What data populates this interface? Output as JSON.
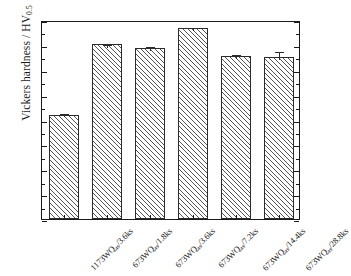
{
  "chart_data": {
    "type": "bar",
    "title": "",
    "xlabel": "",
    "ylabel": "Vickers hardness / HV",
    "ylabel_sub": "0.5",
    "ylim": [
      0,
      400
    ],
    "ytick_step": 50,
    "yminor_step": 25,
    "grid": false,
    "legend": "none",
    "categories": [
      "1173WQ as /3.6ks",
      "673WQ as /1.8ks",
      "673WQ as /3.6ks",
      "673WQ as /7.2ks",
      "673WQ as /14.4ks",
      "673WQ as /28.8ks"
    ],
    "category_parts": [
      {
        "main": "1173WQ",
        "sub": "as",
        "tail": "/3.6ks"
      },
      {
        "main": "673WQ",
        "sub": "as",
        "tail": "/1.8ks"
      },
      {
        "main": "673WQ",
        "sub": "as",
        "tail": "/3.6ks"
      },
      {
        "main": "673WQ",
        "sub": "as",
        "tail": "/7.2ks"
      },
      {
        "main": "673WQ",
        "sub": "as",
        "tail": "/14.4ks"
      },
      {
        "main": "673WQ",
        "sub": "as",
        "tail": "/28.8ks"
      }
    ],
    "values": [
      210,
      351,
      343,
      383,
      327,
      325
    ],
    "errors": [
      5,
      3,
      7,
      5,
      6,
      14
    ],
    "ytick_labels": [
      "0",
      "50",
      "100",
      "150",
      "200",
      "250",
      "300",
      "350",
      "400"
    ],
    "ytick_values": [
      0,
      50,
      100,
      150,
      200,
      250,
      300,
      350,
      400
    ],
    "bar_fill": "hatched-diagonal",
    "bar_edge_color": "#2b2b2b",
    "axis_color": "#1a1a1a",
    "background": "#ffffff"
  }
}
